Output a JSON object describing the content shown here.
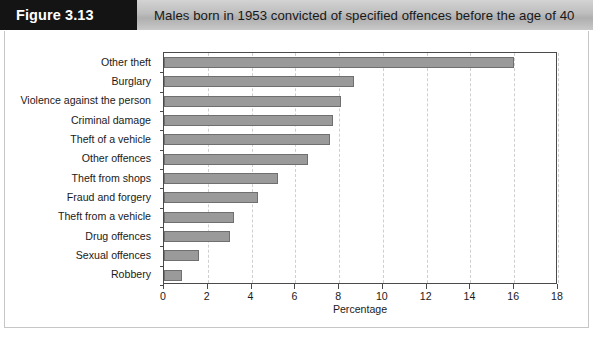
{
  "figure": {
    "tag": "Figure 3.13",
    "title": "Males born in 1953 convicted of specified offences before the age of 40"
  },
  "chart_data": {
    "type": "bar",
    "orientation": "horizontal",
    "title": "Males born in 1953 convicted of specified offences before the age of 40",
    "categories": [
      "Other theft",
      "Burglary",
      "Violence against the person",
      "Criminal damage",
      "Theft of a vehicle",
      "Other offences",
      "Theft from shops",
      "Fraud and forgery",
      "Theft from a vehicle",
      "Drug offences",
      "Sexual offences",
      "Robbery"
    ],
    "values": [
      16.0,
      8.7,
      8.1,
      7.7,
      7.6,
      6.6,
      5.2,
      4.3,
      3.2,
      3.0,
      1.6,
      0.8
    ],
    "xlabel": "Percentage",
    "ylabel": "",
    "xlim": [
      0,
      18
    ],
    "xticks": [
      0,
      2,
      4,
      6,
      8,
      10,
      12,
      14,
      16,
      18
    ],
    "xtick_labels": [
      "0",
      "2",
      "4",
      "6",
      "8",
      "10",
      "12",
      "14",
      "16",
      "18"
    ],
    "grid": "vertical-dashed",
    "legend": "none",
    "colors": {
      "bar_fill": "#9a9a9a",
      "bar_border": "#6f6f6f",
      "gridline": "#cfcfcf",
      "axis": "#4a4a4a",
      "tag_background": "#141414",
      "tag_text": "#ffffff",
      "header_background": "#bdbdbd"
    }
  }
}
